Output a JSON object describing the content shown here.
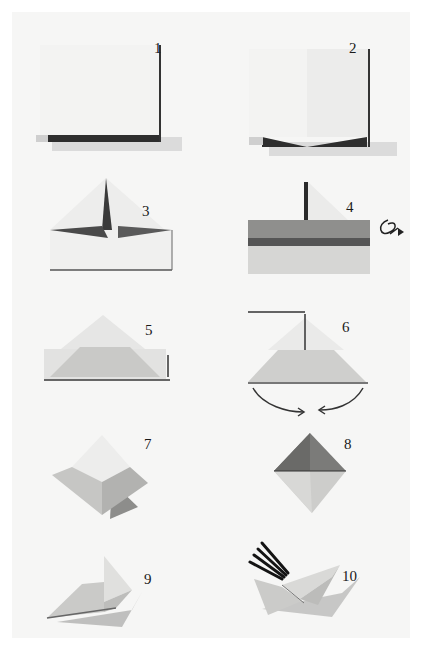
{
  "page": {
    "background": "#ffffff",
    "panel_color": "#f6f6f5",
    "paper_light": "#f1f1ef",
    "paper_mid": "#cfcfcd",
    "paper_dark": "#9a9a98",
    "shadow": "#3a3a3a"
  },
  "steps": [
    {
      "number": "1",
      "description": "square-paper-folded-in-half"
    },
    {
      "number": "2",
      "description": "paper-with-center-crease"
    },
    {
      "number": "3",
      "description": "corners-folded-to-center-triangle"
    },
    {
      "number": "4",
      "description": "bottom-flap-folded-up-turn-over",
      "icon": "turn-over-icon"
    },
    {
      "number": "5",
      "description": "flap-folded-over-triangle"
    },
    {
      "number": "6",
      "description": "open-and-flatten-arrows",
      "icon": "curved-arrows-icon"
    },
    {
      "number": "7",
      "description": "diamond-shape"
    },
    {
      "number": "8",
      "description": "diamond-with-dark-top"
    },
    {
      "number": "9",
      "description": "partially-opened-form"
    },
    {
      "number": "10",
      "description": "finished-holder-with-pencils"
    }
  ]
}
